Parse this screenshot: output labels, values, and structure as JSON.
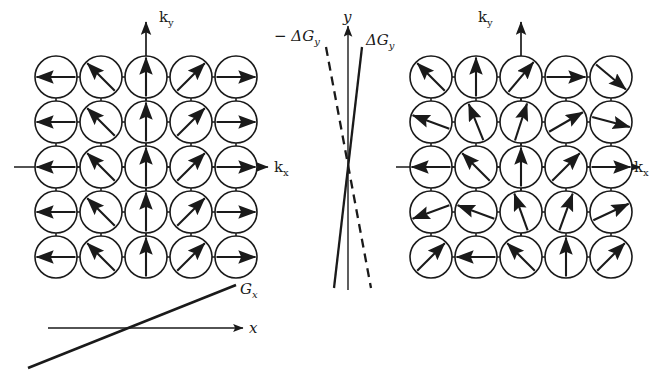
{
  "figure": {
    "title": "",
    "background_color": "#ffffff",
    "stroke_color": "#1a1a1a",
    "labels": {
      "ky_left": "k",
      "ky_left_sub": "y",
      "kx_left": "k",
      "kx_left_sub": "x",
      "ky_right": "k",
      "ky_right_sub": "y",
      "kx_right": "k",
      "kx_right_sub": "x",
      "y_axis": "y",
      "x_axis": "x",
      "gx": "G",
      "gx_sub": "x",
      "dgy_pos": "ΔG",
      "dgy_pos_sub": "y",
      "dgy_neg": "− ΔG",
      "dgy_neg_sub": "y"
    }
  },
  "chart_data": {
    "type": "diagram",
    "panels": [
      {
        "id": "left-lattice",
        "name": "unperturbed-lattice",
        "description": "5x5 lattice of circles with arrows; direction depends only on column",
        "axes": {
          "x": "k_x",
          "y": "k_y"
        },
        "rows": 5,
        "cols": 5,
        "cell_spacing": 45,
        "circle_radius": 21,
        "center": {
          "x": 146,
          "y": 167
        },
        "arrow_angles_deg": [
          [
            180,
            135,
            90,
            45,
            0
          ],
          [
            180,
            135,
            90,
            45,
            0
          ],
          [
            180,
            135,
            90,
            45,
            0
          ],
          [
            180,
            135,
            90,
            45,
            0
          ],
          [
            180,
            135,
            90,
            45,
            0
          ]
        ]
      },
      {
        "id": "right-lattice",
        "name": "perturbed-lattice",
        "description": "5x5 lattice of circles with arrows; direction varies with row and column",
        "axes": {
          "x": "k_x",
          "y": "k_y"
        },
        "rows": 5,
        "cols": 5,
        "cell_spacing": 45,
        "circle_radius": 21,
        "center": {
          "x": 521,
          "y": 167
        },
        "arrow_angles_deg": [
          [
            135,
            90,
            50,
            0,
            -40
          ],
          [
            160,
            112,
            72,
            30,
            -15
          ],
          [
            180,
            135,
            90,
            45,
            0
          ],
          [
            200,
            160,
            110,
            70,
            25
          ],
          [
            45,
            180,
            135,
            90,
            45
          ]
        ]
      },
      {
        "id": "center-gradient",
        "name": "gy-gradient-plot",
        "description": "Vertical y axis with a solid +DeltaG_y line and a dashed -DeltaG_y line crossing near the origin",
        "axes": {
          "y": "y"
        },
        "lines": [
          {
            "label": "ΔG_y",
            "style": "solid",
            "slope_sign": "positive"
          },
          {
            "label": "−ΔG_y",
            "style": "dashed",
            "slope_sign": "negative"
          }
        ],
        "crossing_point": {
          "x": 348,
          "y": 165
        }
      },
      {
        "id": "bottom-gradient",
        "name": "gx-gradient-plot",
        "description": "Horizontal x axis with a thick straight line of positive slope labelled G_x",
        "axes": {
          "x": "x"
        },
        "lines": [
          {
            "label": "G_x",
            "style": "solid",
            "slope_sign": "positive"
          }
        ],
        "crossing_point": {
          "x": 146,
          "y": 328
        }
      }
    ]
  }
}
